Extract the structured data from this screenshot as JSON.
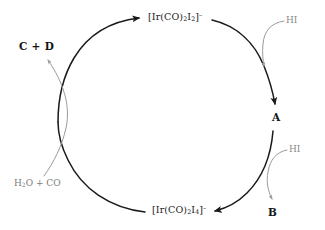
{
  "figure": {
    "kind": "catalytic-cycle-diagram",
    "background_color": "#ffffff",
    "width": 325,
    "height": 230
  },
  "colors": {
    "cycle_arrow": "#1a1a1a",
    "reagent_arrow": "#9a9a9a",
    "species_text": "#151515",
    "formula_text": "#1a1a1a",
    "reagent_text": "#8a8a8a"
  },
  "cycle": {
    "nodes": [
      {
        "id": "node-top",
        "label_plain": "[Ir(CO)2I2]-",
        "parts": {
          "open": "[Ir(CO)",
          "sub1": "2",
          "mid": "I",
          "sub2": "2",
          "close": "]",
          "charge": "–"
        }
      },
      {
        "id": "node-a",
        "label_plain": "A"
      },
      {
        "id": "node-bottom",
        "label_plain": "[Ir(CO)2I4]-",
        "parts": {
          "open": "[Ir(CO)",
          "sub1": "2",
          "mid": "I",
          "sub2": "4",
          "close": "]",
          "charge": "–"
        }
      }
    ]
  },
  "reagents": {
    "hi_top": "HI",
    "hi_bottom": "HI",
    "water_co": {
      "open": "H",
      "sub": "2",
      "close": "O + CO"
    }
  },
  "products": {
    "c_plus_d": "C + D",
    "b": "B"
  }
}
